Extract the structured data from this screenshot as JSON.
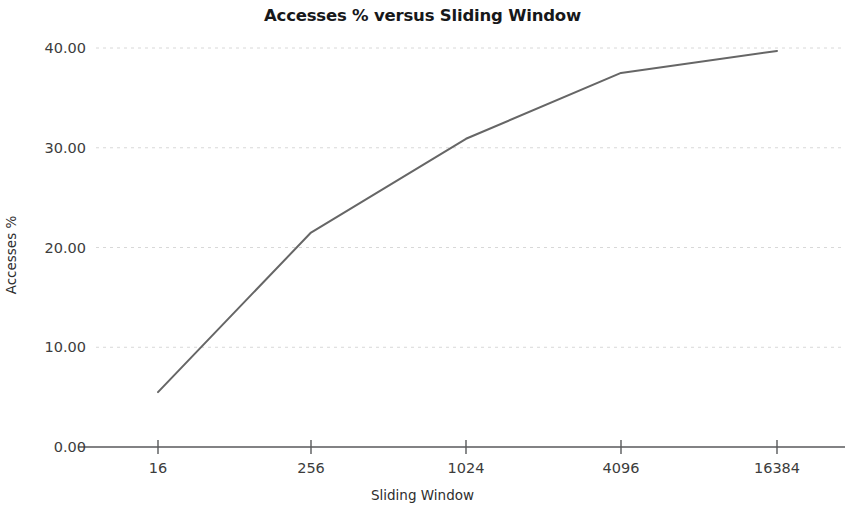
{
  "chart_data": {
    "type": "line",
    "title": "Accesses % versus Sliding Window",
    "xlabel": "Sliding Window",
    "ylabel": "Accesses %",
    "categories": [
      "16",
      "256",
      "1024",
      "4096",
      "16384"
    ],
    "x": [
      16,
      256,
      1024,
      4096,
      16384
    ],
    "values": [
      5.5,
      21.5,
      30.9,
      37.5,
      39.7
    ],
    "series": [
      {
        "name": "Accesses %",
        "values": [
          5.5,
          21.5,
          30.9,
          37.5,
          39.7
        ],
        "color": "#666666"
      }
    ],
    "x_tick_labels": [
      "16",
      "256",
      "1024",
      "4096",
      "16384"
    ],
    "y_tick_labels": [
      "0.00",
      "10.00",
      "20.00",
      "30.00",
      "40.00"
    ],
    "y_ticks": [
      0,
      10,
      20,
      30,
      40
    ],
    "ylim": [
      0,
      40
    ],
    "grid": "horizontal",
    "legend": "none",
    "x_scale": "categorical-log2",
    "line_color": "#666666",
    "grid_color": "#d8d8d8",
    "axis_color": "#58595b"
  }
}
